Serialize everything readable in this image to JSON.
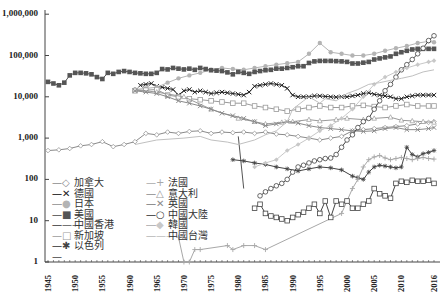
{
  "chart_data": {
    "type": "line",
    "title": "",
    "xlabel": "",
    "ylabel": "",
    "yscale": "log",
    "ylim": [
      1,
      1000000
    ],
    "xlim": [
      1945,
      2016
    ],
    "grid": false,
    "legend_position": "lower-left inside",
    "y_ticks": [
      "1,000,000",
      "100,000",
      "10,000",
      "1,000",
      "100",
      "10",
      "1"
    ],
    "y_tick_values": [
      1000000,
      100000,
      10000,
      1000,
      100,
      10,
      1
    ],
    "x_ticks": [
      "1945",
      "1950",
      "1955",
      "1960",
      "1965",
      "1970",
      "1975",
      "1980",
      "1985",
      "1990",
      "1995",
      "2000",
      "2005",
      "2010",
      "2016"
    ],
    "series": [
      {
        "name": "加拿大",
        "color": "#8a8a8a",
        "marker": "diamond-open",
        "x": [
          1945,
          1947,
          1949,
          1951,
          1953,
          1955,
          1957,
          1959,
          1961,
          1963,
          1965,
          1967,
          1969,
          1971,
          1973,
          1975,
          1977,
          1979,
          1981,
          1983,
          1985,
          1987,
          1989,
          1991,
          1993,
          1995,
          1997,
          1999,
          2001,
          2003,
          2005,
          2007,
          2009,
          2011,
          2013,
          2015,
          2016
        ],
        "values": [
          500,
          520,
          560,
          650,
          700,
          820,
          620,
          700,
          820,
          1300,
          1200,
          1400,
          1300,
          1450,
          1500,
          1300,
          1400,
          1350,
          1400,
          1300,
          1400,
          1250,
          1200,
          1100,
          1000,
          900,
          1000,
          1100,
          1500,
          1600,
          1700,
          1800,
          1900,
          2000,
          2200,
          2400,
          2500
        ]
      },
      {
        "name": "德國",
        "color": "#222222",
        "marker": "x",
        "x": [
          1962,
          1963,
          1964,
          1965,
          1966,
          1967,
          1968,
          1969,
          1970,
          1971,
          1972,
          1973,
          1974,
          1975,
          1976,
          1977,
          1978,
          1979,
          1980,
          1981,
          1982,
          1983,
          1984,
          1985,
          1986,
          1987,
          1988,
          1989,
          1990,
          1991,
          1992,
          1993,
          1994,
          1995,
          1996,
          1997,
          1998,
          1999,
          2000,
          2001,
          2002,
          2003,
          2004,
          2005,
          2006,
          2007,
          2008,
          2009,
          2010,
          2011,
          2012,
          2013,
          2014,
          2015,
          2016
        ],
        "values": [
          19000,
          20000,
          21000,
          18000,
          17000,
          16000,
          15000,
          11000,
          14000,
          15000,
          13000,
          14000,
          13000,
          12000,
          12500,
          13000,
          12500,
          12000,
          11500,
          11000,
          13000,
          18000,
          19000,
          20000,
          21000,
          20000,
          19000,
          16000,
          11000,
          10000,
          10000,
          10000,
          10500,
          10500,
          10200,
          10000,
          9800,
          10000,
          10000,
          10500,
          11000,
          12000,
          12500,
          11500,
          11000,
          10500,
          10000,
          9000,
          9000,
          10000,
          10500,
          11000,
          11000,
          11000,
          11000
        ]
      },
      {
        "name": "日本",
        "color": "#b4b4b4",
        "marker": "circle-filled",
        "x": [
          1961,
          1963,
          1965,
          1967,
          1969,
          1971,
          1973,
          1975,
          1977,
          1979,
          1981,
          1983,
          1985,
          1987,
          1989,
          1991,
          1993,
          1995,
          1997,
          1999,
          2001,
          2003,
          2005,
          2007,
          2009,
          2011,
          2013,
          2015,
          2016
        ],
        "values": [
          15000,
          16000,
          17000,
          22000,
          28000,
          33000,
          38000,
          45000,
          50000,
          47000,
          45000,
          50000,
          55000,
          60000,
          65000,
          70000,
          110000,
          200000,
          120000,
          110000,
          100000,
          100000,
          110000,
          130000,
          150000,
          170000,
          200000,
          220000,
          210000
        ]
      },
      {
        "name": "美國",
        "color": "#555555",
        "marker": "square-filled",
        "x": [
          1945,
          1946,
          1947,
          1948,
          1949,
          1950,
          1951,
          1952,
          1953,
          1954,
          1955,
          1956,
          1957,
          1958,
          1959,
          1960,
          1961,
          1962,
          1963,
          1964,
          1965,
          1966,
          1967,
          1968,
          1969,
          1970,
          1971,
          1972,
          1973,
          1974,
          1975,
          1976,
          1977,
          1978,
          1979,
          1980,
          1981,
          1982,
          1983,
          1984,
          1985,
          1986,
          1987,
          1988,
          1989,
          1990,
          1991,
          1992,
          1993,
          1994,
          1995,
          1996,
          1997,
          1998,
          1999,
          2000,
          2001,
          2002,
          2003,
          2004,
          2005,
          2006,
          2007,
          2008,
          2009,
          2010,
          2011,
          2012,
          2013,
          2014,
          2015,
          2016
        ],
        "values": [
          23000,
          21000,
          19000,
          22000,
          33000,
          38000,
          38000,
          37000,
          35000,
          30000,
          27000,
          38000,
          36000,
          40000,
          42000,
          40000,
          38000,
          37000,
          36000,
          36000,
          38000,
          47000,
          46000,
          50000,
          48000,
          46000,
          48000,
          45000,
          50000,
          47000,
          44000,
          43000,
          42000,
          39000,
          35000,
          40000,
          38000,
          36000,
          40000,
          42000,
          44000,
          45000,
          48000,
          48000,
          50000,
          52000,
          55000,
          55000,
          66000,
          72000,
          74000,
          74000,
          74000,
          73000,
          72000,
          70000,
          64000,
          64000,
          67000,
          70000,
          80000,
          85000,
          90000,
          95000,
          110000,
          120000,
          130000,
          140000,
          145000,
          145000,
          145000,
          145000
        ]
      },
      {
        "name": "中國香港",
        "color": "#555555",
        "marker": "none",
        "x": [
          1980,
          1981
        ],
        "values": [
          1100,
          60
        ]
      },
      {
        "name": "新加坡",
        "color": "#9a9a9a",
        "marker": "square-open",
        "x": [
          1961,
          1963,
          1965,
          1967,
          1969,
          1971,
          1973,
          1975,
          1977,
          1979,
          1981,
          1983,
          1985,
          1987,
          1989,
          1991,
          1993,
          1995,
          1997,
          1999,
          2001,
          2003,
          2005,
          2007,
          2009,
          2011,
          2013,
          2015,
          2016
        ],
        "values": [
          14000,
          14500,
          15000,
          11000,
          10000,
          9000,
          8500,
          8000,
          7500,
          7000,
          7000,
          6000,
          5500,
          5000,
          4500,
          5000,
          5500,
          6000,
          5500,
          5500,
          6000,
          6200,
          5800,
          5500,
          6000,
          6500,
          6000,
          6000,
          6000
        ]
      },
      {
        "name": "以色列",
        "color": "#444444",
        "marker": "star",
        "x": [
          1979,
          1981,
          1983,
          1985,
          1987,
          1989,
          1991,
          1993,
          1995,
          1997,
          1999,
          2001,
          2002,
          2003,
          2004,
          2005,
          2006,
          2007,
          2008,
          2009,
          2010,
          2011,
          2012,
          2013,
          2014,
          2015,
          2016
        ],
        "values": [
          300,
          280,
          250,
          230,
          200,
          180,
          160,
          180,
          200,
          190,
          170,
          120,
          110,
          100,
          150,
          200,
          220,
          210,
          200,
          190,
          200,
          600,
          400,
          350,
          420,
          450,
          500
        ]
      },
      {
        "name": "法國",
        "color": "#a8a8a8",
        "marker": "plus",
        "x": [
          1969,
          1970,
          1971,
          1972,
          1973,
          1978,
          1979,
          1981,
          1983,
          1985,
          1999,
          2000,
          2001,
          2002,
          2003,
          2004,
          2005,
          2006,
          2007,
          2008,
          2009,
          2010,
          2011,
          2012,
          2013,
          2014,
          2015,
          2016
        ],
        "values": [
          4,
          1,
          1,
          2,
          2,
          2.5,
          2,
          2.5,
          2.5,
          2,
          15,
          30,
          60,
          100,
          200,
          300,
          350,
          380,
          330,
          300,
          320,
          340,
          320,
          300,
          320,
          340,
          320,
          310
        ]
      },
      {
        "name": "意大利",
        "color": "#9a9a9a",
        "marker": "triangle-open",
        "x": [
          1961,
          1965,
          1970,
          1975,
          1980,
          1983,
          1985,
          1988,
          1990,
          1993,
          1995,
          1998,
          2000,
          2003,
          2005,
          2008,
          2010,
          2012,
          2014,
          2016
        ],
        "values": [
          15000,
          13000,
          10000,
          5000,
          3000,
          2500,
          2200,
          2400,
          2500,
          2800,
          2600,
          2800,
          3000,
          2800,
          3000,
          3200,
          2700,
          2600,
          2500,
          2400
        ]
      },
      {
        "name": "英國",
        "color": "#8a8a8a",
        "marker": "x-open",
        "x": [
          1961,
          1963,
          1965,
          1967,
          1969,
          1971,
          1973,
          1975,
          1977,
          1979,
          1981,
          1983,
          1985,
          1987,
          1989,
          1991,
          1993,
          1995,
          1997,
          1999,
          2001,
          2003,
          2005,
          2007,
          2009,
          2011,
          2013,
          2015,
          2016
        ],
        "values": [
          14000,
          13000,
          12000,
          10000,
          8000,
          7000,
          6000,
          5000,
          4000,
          3500,
          3000,
          2500,
          2000,
          2200,
          2500,
          2300,
          2000,
          1800,
          1700,
          1600,
          1500,
          1450,
          1500,
          1700,
          1800,
          1600,
          1600,
          1700,
          1800
        ]
      },
      {
        "name": "中國大陸",
        "color": "#444444",
        "marker": "circle-open",
        "x": [
          1984,
          1985,
          1986,
          1987,
          1988,
          1989,
          1990,
          1991,
          1992,
          1993,
          1994,
          1995,
          1996,
          1997,
          1998,
          1999,
          2000,
          2001,
          2002,
          2003,
          2004,
          2005,
          2006,
          2007,
          2008,
          2009,
          2010,
          2011,
          2012,
          2013,
          2014,
          2015,
          2016
        ],
        "values": [
          40,
          50,
          60,
          70,
          80,
          100,
          150,
          200,
          220,
          250,
          280,
          300,
          320,
          330,
          400,
          600,
          900,
          1200,
          1800,
          2500,
          3000,
          5000,
          8000,
          14000,
          20000,
          30000,
          45000,
          60000,
          80000,
          110000,
          150000,
          230000,
          300000
        ]
      },
      {
        "name": "韓國",
        "color": "#c8c8c8",
        "marker": "diamond-filled",
        "x": [
          1983,
          1985,
          1987,
          1989,
          1991,
          1993,
          1995,
          1997,
          1999,
          2001,
          2003,
          2005,
          2007,
          2009,
          2011,
          2013,
          2015,
          2016
        ],
        "values": [
          200,
          250,
          300,
          500,
          700,
          1000,
          1500,
          2000,
          3000,
          5000,
          10000,
          20000,
          30000,
          40000,
          50000,
          60000,
          70000,
          75000
        ]
      },
      {
        "name": "中國台灣",
        "color": "#c0c0c0",
        "marker": "none",
        "x": [
          1961,
          1965,
          1970,
          1973,
          1975,
          1978,
          1980,
          1983,
          1985,
          1987,
          1989,
          1990,
          1992,
          1993,
          1995,
          1996,
          1998,
          2000,
          2002,
          2004,
          2006,
          2008,
          2010,
          2012,
          2014,
          2016
        ],
        "values": [
          700,
          900,
          1000,
          1100,
          900,
          800,
          700,
          900,
          1200,
          1500,
          2500,
          5000,
          8000,
          10000,
          7000,
          9000,
          8000,
          12000,
          15000,
          20000,
          22000,
          25000,
          28000,
          32000,
          40000,
          45000
        ]
      },
      {
        "name": "以色列(late segment)",
        "hidden_in_legend": true,
        "color": "#444444",
        "marker": "square-open",
        "x": [
          1983,
          1984,
          1985,
          1986,
          1987,
          1988,
          1989,
          1990,
          1991,
          1992,
          1993,
          1994,
          1995,
          1996,
          1997,
          1998,
          1999,
          2000,
          2001,
          2002,
          2003,
          2004,
          2005,
          2006,
          2007,
          2008,
          2009,
          2010,
          2011,
          2012,
          2013,
          2014,
          2015,
          2016
        ],
        "values": [
          20,
          25,
          15,
          13,
          12,
          11,
          10,
          12,
          14,
          16,
          20,
          25,
          15,
          30,
          12,
          30,
          25,
          30,
          20,
          20,
          25,
          30,
          60,
          45,
          40,
          35,
          80,
          90,
          85,
          95,
          90,
          90,
          95,
          80
        ]
      }
    ]
  },
  "legend": {
    "col1": [
      {
        "label": "加拿大",
        "marker": "◇"
      },
      {
        "label": "德國",
        "marker": "✕"
      },
      {
        "label": "日本",
        "marker": "●"
      },
      {
        "label": "美國",
        "marker": "■"
      },
      {
        "label": "中國香港",
        "marker": ""
      },
      {
        "label": "新加坡",
        "marker": "□"
      },
      {
        "label": "以色列",
        "marker": "✱"
      }
    ],
    "col2": [
      {
        "label": "法國",
        "marker": "+"
      },
      {
        "label": "意大利",
        "marker": "△"
      },
      {
        "label": "英國",
        "marker": "✕"
      },
      {
        "label": "中國大陸",
        "marker": "○"
      },
      {
        "label": "韓國",
        "marker": "◆"
      },
      {
        "label": "中國台灣",
        "marker": ""
      }
    ]
  }
}
